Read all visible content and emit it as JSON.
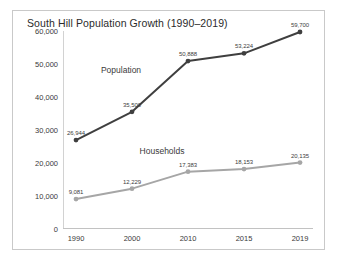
{
  "chart_data": {
    "type": "line",
    "title": "South Hill Population Growth (1990–2019)",
    "xlabel": "",
    "ylabel": "",
    "categories": [
      "1990",
      "2000",
      "2010",
      "2015",
      "2019"
    ],
    "ylim": [
      0,
      60000
    ],
    "yticks": [
      0,
      10000,
      20000,
      30000,
      40000,
      50000,
      60000
    ],
    "ytick_labels": [
      "0",
      "10,000",
      "20,000",
      "30,000",
      "40,000",
      "50,000",
      "60,000"
    ],
    "grid": false,
    "legend_position": "inline-labels",
    "series": [
      {
        "name": "Population",
        "color": "#3f3f3f",
        "values": [
          26944,
          35500,
          50888,
          53224,
          59700
        ],
        "data_labels": [
          "26,944",
          "35,500",
          "50,888",
          "53,224",
          "59,700"
        ]
      },
      {
        "name": "Households",
        "color": "#a6a6a6",
        "values": [
          9081,
          12229,
          17383,
          18153,
          20135
        ],
        "data_labels": [
          "9,081",
          "12,229",
          "17,383",
          "18,153",
          "20,135"
        ]
      }
    ]
  },
  "colors": {
    "frame_border": "#c9c9c9",
    "axis": "#cccccc",
    "text": "#3a3a3a",
    "background": "#ffffff"
  }
}
